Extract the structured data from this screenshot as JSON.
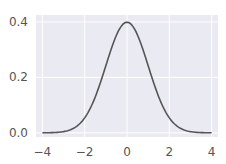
{
  "chart_data": {
    "type": "line",
    "title": "",
    "xlabel": "",
    "ylabel": "",
    "xlim": [
      -4.3,
      4.3
    ],
    "ylim": [
      -0.015,
      0.425
    ],
    "grid": true,
    "style": "seaborn-darkgrid",
    "x_ticks": [
      -4,
      -2,
      0,
      2,
      4
    ],
    "x_tick_labels": [
      "−4",
      "−2",
      "0",
      "2",
      "4"
    ],
    "y_ticks": [
      0.0,
      0.2,
      0.4
    ],
    "y_tick_labels": [
      "0.0",
      "0.2",
      "0.4"
    ],
    "series": [
      {
        "name": "standard normal pdf",
        "color": "#555555",
        "x": [
          -4,
          -3.5,
          -3,
          -2.5,
          -2,
          -1.5,
          -1,
          -0.5,
          0,
          0.5,
          1,
          1.5,
          2,
          2.5,
          3,
          3.5,
          4
        ],
        "y": [
          0.0001,
          0.0009,
          0.0044,
          0.0175,
          0.054,
          0.1295,
          0.242,
          0.3521,
          0.3989,
          0.3521,
          0.242,
          0.1295,
          0.054,
          0.0175,
          0.0044,
          0.0009,
          0.0001
        ]
      }
    ],
    "colors": {
      "background": "#eaeaf2",
      "grid": "#ffffff",
      "line": "#555555"
    }
  }
}
